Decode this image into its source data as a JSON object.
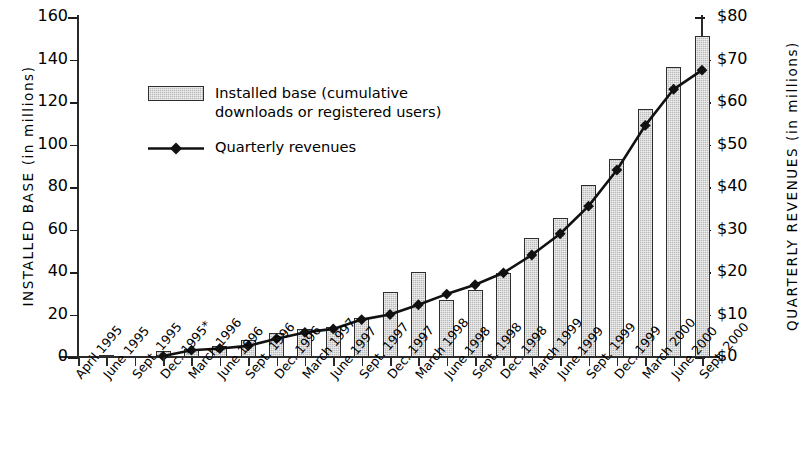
{
  "chart_data": {
    "type": "bar",
    "title": "",
    "subtitle": "",
    "xlabel": "",
    "ylabel": "INSTALLED BASE  (in millions)",
    "ylabel_right": "QUARTERLY REVENUES  (in millions)",
    "grid": false,
    "legend_position": "upper-left",
    "ylim": [
      0,
      160
    ],
    "ylim_right": [
      0,
      80
    ],
    "yticks": [
      "0",
      "20",
      "40",
      "60",
      "80",
      "100",
      "120",
      "140",
      "160"
    ],
    "ytick_values": [
      0,
      20,
      40,
      60,
      80,
      100,
      120,
      140,
      160
    ],
    "yticks_right": [
      "$0",
      "$10",
      "$20",
      "$30",
      "$40",
      "$50",
      "$60",
      "$70",
      "$80"
    ],
    "ytick_values_right": [
      0,
      10,
      20,
      30,
      40,
      50,
      60,
      70,
      80
    ],
    "categories": [
      "April 1995",
      "June 1995",
      "Sept. 1995",
      "Dec. 1995*",
      "March 1996",
      "June 1996",
      "Sept. 1996",
      "Dec. 1996",
      "March 1997",
      "June 1997",
      "Sept. 1997",
      "Dec. 1997",
      "March 1998",
      "June 1998",
      "Sept. 1998",
      "Dec. 1998",
      "March 1999",
      "June 1999",
      "Sept. 1999",
      "Dec. 1999",
      "March 2000",
      "June 2000",
      "Sept. 2000"
    ],
    "series": [
      {
        "name": "Installed base (cumulative downloads or registered users)",
        "type": "bar",
        "axis": "left",
        "unit": "millions",
        "values": [
          0,
          0.4,
          0,
          3,
          4,
          5,
          8,
          11.5,
          13,
          14,
          18.5,
          30.5,
          40,
          27,
          31.5,
          39.5,
          56,
          65.5,
          81,
          93,
          116.5,
          136.5,
          151
        ]
      },
      {
        "name": "Quarterly revenues",
        "type": "line",
        "axis": "right",
        "unit": "$ millions",
        "values": [
          null,
          null,
          null,
          0.2,
          1.6,
          2.0,
          2.6,
          4.3,
          5.8,
          6.6,
          8.8,
          10.0,
          12.3,
          14.8,
          17.0,
          19.8,
          24.0,
          29.0,
          35.5,
          44.0,
          54.5,
          63.0,
          67.5
        ],
        "values_in_left_axis_units": [
          null,
          null,
          null,
          0.4,
          3.2,
          4.0,
          5.2,
          8.6,
          11.6,
          13.2,
          17.6,
          20.0,
          24.6,
          29.6,
          34.0,
          39.6,
          48.0,
          58.0,
          71.0,
          88.0,
          109.0,
          126.0,
          135.0
        ]
      }
    ]
  },
  "legend": {
    "items": [
      {
        "label_line1": "Installed base (cumulative",
        "label_line2": "downloads or registered users)",
        "marker": "filled-bar-swatch"
      },
      {
        "label_line1": "Quarterly revenues",
        "label_line2": "",
        "marker": "line-with-diamond"
      }
    ]
  },
  "colors": {
    "bar_fill": "#b9b9b9",
    "bar_border": "#2e2e2e",
    "line": "#111111",
    "marker": "#111111",
    "axis": "#2a2a2a",
    "text": "#000000",
    "background": "#ffffff"
  }
}
